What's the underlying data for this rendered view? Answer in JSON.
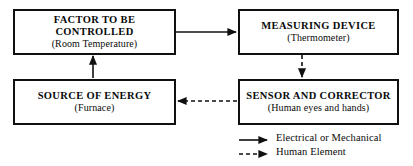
{
  "diagram": {
    "stroke_color": "#101010",
    "background_color": "#ffffff",
    "nodes": [
      {
        "id": "factor",
        "title": "FACTOR TO BE\nCONTROLLED",
        "subtitle": "(Room Temperature)"
      },
      {
        "id": "measuring-device",
        "title": "MEASURING DEVICE",
        "subtitle": "(Thermometer)"
      },
      {
        "id": "source-of-energy",
        "title": "SOURCE OF ENERGY",
        "subtitle": "(Furnace)"
      },
      {
        "id": "sensor-and-corrector",
        "title": "SENSOR AND CORRECTOR",
        "subtitle": "(Human eyes and hands)"
      }
    ],
    "connectors": [
      {
        "id": "factor-to-measuring-device",
        "from": "factor",
        "to": "measuring-device",
        "style": "solid",
        "direction": "right"
      },
      {
        "id": "measuring-device-to-sensor",
        "from": "measuring-device",
        "to": "sensor-and-corrector",
        "style": "dashed",
        "direction": "down"
      },
      {
        "id": "sensor-to-source-of-energy",
        "from": "sensor-and-corrector",
        "to": "source-of-energy",
        "style": "dashed",
        "direction": "left"
      },
      {
        "id": "source-of-energy-to-factor",
        "from": "source-of-energy",
        "to": "factor",
        "style": "solid",
        "direction": "up"
      }
    ]
  },
  "legend": {
    "items": [
      {
        "style": "solid",
        "label": "Electrical or Mechanical"
      },
      {
        "style": "dashed",
        "label": "Human Element"
      }
    ]
  }
}
